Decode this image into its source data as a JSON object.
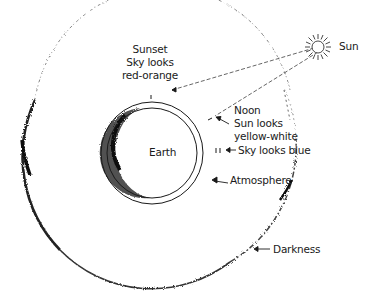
{
  "diagram": {
    "type": "Earth, atmosphere and sunlight path diagram",
    "labels": {
      "sun": "Sun",
      "sunset_line1": "Sunset",
      "sunset_line2": "Sky looks",
      "sunset_line3": "red-orange",
      "noon_line1": "Noon",
      "noon_line2": "Sun looks",
      "noon_line3": "yellow-white",
      "sky_blue": "Sky looks blue",
      "earth": "Earth",
      "atmosphere": "Atmosphere",
      "darkness": "Darkness"
    },
    "colors": {
      "ink": "#1a1a1a",
      "background": "#ffffff",
      "shading": "#2a2a2a"
    }
  }
}
